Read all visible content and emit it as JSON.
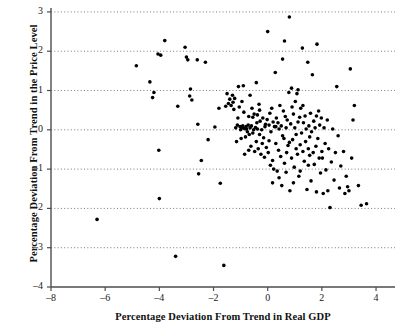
{
  "chart_data": {
    "type": "scatter",
    "title": "",
    "xlabel": "Percentage Deviation From Trend in Real GDP",
    "ylabel": "Percentage Deviation From Trend in the Price Level",
    "xlim": [
      -8,
      4.7
    ],
    "ylim": [
      -4,
      3.1
    ],
    "xticks": [
      -8,
      -6,
      -4,
      -2,
      0,
      2,
      4
    ],
    "xticklabels": [
      "–8",
      "–6",
      "–4",
      "–2",
      "0",
      "2",
      "4"
    ],
    "yticks": [
      -4,
      -3,
      -2,
      -1,
      0,
      1,
      2,
      3
    ],
    "yticklabels": [
      "–4",
      "–3",
      "–2",
      "–1",
      "0",
      "1",
      "2",
      "3"
    ],
    "grid": {
      "horizontal": true,
      "vertical": false,
      "style": "dotted",
      "color": "#555555",
      "values": [
        3,
        2,
        1,
        0,
        -1,
        -2,
        -3
      ]
    },
    "marker": {
      "shape": "circle",
      "color": "#000000",
      "size_px": 3.6
    },
    "axis_color": "#4d4d4d",
    "points": [
      [
        -6.3,
        -2.28
      ],
      [
        -4.85,
        1.63
      ],
      [
        -4.35,
        1.22
      ],
      [
        -4.25,
        0.82
      ],
      [
        -4.2,
        0.95
      ],
      [
        -4.05,
        1.93
      ],
      [
        -4.02,
        -0.52
      ],
      [
        -4.0,
        -1.75
      ],
      [
        -3.95,
        1.9
      ],
      [
        -3.8,
        2.27
      ],
      [
        -3.4,
        -3.22
      ],
      [
        -3.32,
        0.6
      ],
      [
        -3.05,
        2.1
      ],
      [
        -3.0,
        1.85
      ],
      [
        -2.95,
        1.78
      ],
      [
        -2.88,
        0.86
      ],
      [
        -2.85,
        1.04
      ],
      [
        -2.8,
        0.76
      ],
      [
        -2.6,
        1.78
      ],
      [
        -2.58,
        0.14
      ],
      [
        -2.55,
        -1.12
      ],
      [
        -2.45,
        -0.78
      ],
      [
        -2.3,
        1.72
      ],
      [
        -2.2,
        -0.25
      ],
      [
        -1.95,
        0.07
      ],
      [
        -1.8,
        0.55
      ],
      [
        -1.75,
        -1.36
      ],
      [
        -1.62,
        -3.45
      ],
      [
        -1.55,
        0.6
      ],
      [
        -1.45,
        0.67
      ],
      [
        -1.4,
        0.78
      ],
      [
        -1.35,
        0.62
      ],
      [
        -1.3,
        0.88
      ],
      [
        -1.28,
        0.7
      ],
      [
        -1.22,
        0.8
      ],
      [
        -1.18,
        0.05
      ],
      [
        -1.15,
        -0.3
      ],
      [
        -1.12,
        0.12
      ],
      [
        -1.08,
        1.1
      ],
      [
        -1.05,
        0.58
      ],
      [
        -1.02,
        0.08
      ],
      [
        -1.0,
        0.0
      ],
      [
        -0.98,
        -0.22
      ],
      [
        -0.95,
        0.05
      ],
      [
        -0.92,
        0.1
      ],
      [
        -0.9,
        1.12
      ],
      [
        -0.88,
        0.45
      ],
      [
        -0.85,
        0.03
      ],
      [
        -0.82,
        -0.18
      ],
      [
        -0.8,
        0.08
      ],
      [
        -0.78,
        0.02
      ],
      [
        -0.75,
        -0.05
      ],
      [
        -0.72,
        0.12
      ],
      [
        -0.7,
        0.34
      ],
      [
        -0.68,
        -0.12
      ],
      [
        -0.65,
        0.05
      ],
      [
        -0.62,
        -0.42
      ],
      [
        -0.6,
        0.1
      ],
      [
        -0.58,
        0.55
      ],
      [
        -0.55,
        -0.08
      ],
      [
        -0.52,
        0.0
      ],
      [
        -0.5,
        0.4
      ],
      [
        -0.48,
        -0.55
      ],
      [
        -0.45,
        0.06
      ],
      [
        -0.42,
        -0.3
      ],
      [
        -0.4,
        0.18
      ],
      [
        -0.38,
        0.02
      ],
      [
        -0.35,
        -0.48
      ],
      [
        -0.32,
        0.65
      ],
      [
        -0.3,
        -0.12
      ],
      [
        -0.28,
        0.22
      ],
      [
        -0.25,
        -0.62
      ],
      [
        -0.22,
        0.0
      ],
      [
        -0.2,
        -0.35
      ],
      [
        -0.18,
        0.3
      ],
      [
        -0.15,
        -0.2
      ],
      [
        -0.12,
        -0.7
      ],
      [
        -0.1,
        0.08
      ],
      [
        -0.08,
        0.14
      ],
      [
        -0.05,
        -0.45
      ],
      [
        -0.02,
        0.26
      ],
      [
        0.0,
        2.5
      ],
      [
        0.02,
        -0.58
      ],
      [
        0.05,
        0.12
      ],
      [
        0.08,
        0.42
      ],
      [
        0.1,
        -0.9
      ],
      [
        0.12,
        -0.05
      ],
      [
        0.15,
        0.55
      ],
      [
        0.18,
        -0.78
      ],
      [
        0.2,
        0.2
      ],
      [
        0.22,
        -1.0
      ],
      [
        0.25,
        0.08
      ],
      [
        0.28,
        1.46
      ],
      [
        0.3,
        -0.35
      ],
      [
        0.32,
        0.3
      ],
      [
        0.35,
        -1.05
      ],
      [
        0.38,
        0.18
      ],
      [
        0.4,
        -0.52
      ],
      [
        0.42,
        0.02
      ],
      [
        0.45,
        0.62
      ],
      [
        0.48,
        -0.68
      ],
      [
        0.5,
        0.1
      ],
      [
        0.52,
        -1.42
      ],
      [
        0.55,
        1.8
      ],
      [
        0.58,
        0.48
      ],
      [
        0.6,
        -0.22
      ],
      [
        0.62,
        -0.85
      ],
      [
        0.65,
        0.34
      ],
      [
        0.68,
        0.05
      ],
      [
        0.7,
        -0.58
      ],
      [
        0.72,
        0.25
      ],
      [
        0.75,
        -0.4
      ],
      [
        0.78,
        0.95
      ],
      [
        0.8,
        2.87
      ],
      [
        0.82,
        -1.55
      ],
      [
        0.85,
        0.15
      ],
      [
        0.88,
        -0.72
      ],
      [
        0.9,
        0.58
      ],
      [
        0.92,
        -0.25
      ],
      [
        0.95,
        0.4
      ],
      [
        0.98,
        -0.95
      ],
      [
        1.0,
        0.05
      ],
      [
        1.02,
        0.72
      ],
      [
        1.05,
        -0.48
      ],
      [
        1.08,
        0.92
      ],
      [
        1.1,
        -0.62
      ],
      [
        1.12,
        0.2
      ],
      [
        1.15,
        -1.18
      ],
      [
        1.18,
        0.32
      ],
      [
        1.2,
        -0.38
      ],
      [
        1.22,
        0.55
      ],
      [
        1.25,
        -0.08
      ],
      [
        1.28,
        2.08
      ],
      [
        1.3,
        -0.55
      ],
      [
        1.32,
        0.18
      ],
      [
        1.35,
        -0.8
      ],
      [
        1.38,
        0.35
      ],
      [
        1.4,
        -0.3
      ],
      [
        1.42,
        0.02
      ],
      [
        1.45,
        -1.52
      ],
      [
        1.48,
        1.72
      ],
      [
        1.5,
        -0.48
      ],
      [
        1.52,
        0.1
      ],
      [
        1.55,
        -0.65
      ],
      [
        1.58,
        0.42
      ],
      [
        1.6,
        -1.3
      ],
      [
        1.62,
        -0.05
      ],
      [
        1.65,
        1.4
      ],
      [
        1.68,
        -0.58
      ],
      [
        1.7,
        0.22
      ],
      [
        1.72,
        -0.88
      ],
      [
        1.75,
        0.05
      ],
      [
        1.78,
        -0.42
      ],
      [
        1.8,
        -1.58
      ],
      [
        1.82,
        2.18
      ],
      [
        1.85,
        -0.22
      ],
      [
        1.88,
        0.48
      ],
      [
        1.9,
        -0.72
      ],
      [
        1.92,
        0.12
      ],
      [
        1.95,
        -1.1
      ],
      [
        1.98,
        0.3
      ],
      [
        2.0,
        -0.55
      ],
      [
        2.05,
        -1.62
      ],
      [
        2.08,
        0.05
      ],
      [
        2.12,
        -0.35
      ],
      [
        2.15,
        -1.02
      ],
      [
        2.2,
        0.25
      ],
      [
        2.25,
        -0.48
      ],
      [
        2.3,
        -1.98
      ],
      [
        2.35,
        -0.82
      ],
      [
        2.4,
        0.02
      ],
      [
        2.45,
        -1.28
      ],
      [
        2.5,
        -0.58
      ],
      [
        2.55,
        1.1
      ],
      [
        2.6,
        -0.15
      ],
      [
        2.65,
        -1.48
      ],
      [
        2.7,
        -0.92
      ],
      [
        2.8,
        -0.55
      ],
      [
        2.85,
        -1.62
      ],
      [
        2.9,
        -1.18
      ],
      [
        2.95,
        -1.45
      ],
      [
        3.0,
        -1.55
      ],
      [
        3.05,
        1.55
      ],
      [
        3.1,
        -0.72
      ],
      [
        3.15,
        0.25
      ],
      [
        3.2,
        0.62
      ],
      [
        3.35,
        -1.42
      ],
      [
        3.45,
        -1.92
      ],
      [
        3.65,
        -1.88
      ],
      [
        -1.5,
        0.92
      ],
      [
        -1.25,
        0.52
      ],
      [
        -0.95,
        0.72
      ],
      [
        -0.7,
        -0.52
      ],
      [
        -0.55,
        0.32
      ],
      [
        -0.3,
        0.5
      ],
      [
        0.05,
        -0.28
      ],
      [
        0.3,
        0.08
      ],
      [
        0.55,
        -0.15
      ],
      [
        0.8,
        -0.32
      ],
      [
        1.05,
        -0.12
      ],
      [
        1.3,
        0.62
      ],
      [
        1.55,
        -0.18
      ],
      [
        1.8,
        0.35
      ],
      [
        0.88,
        1.06
      ],
      [
        1.12,
        1.02
      ],
      [
        -0.42,
        1.2
      ],
      [
        0.62,
        2.26
      ],
      [
        -1.1,
        0.3
      ],
      [
        -0.85,
        -0.62
      ],
      [
        0.18,
        -1.35
      ],
      [
        0.42,
        -1.22
      ],
      [
        0.68,
        -1.08
      ],
      [
        0.95,
        -1.35
      ],
      [
        1.2,
        -1.05
      ],
      [
        1.5,
        -0.9
      ],
      [
        2.02,
        -0.72
      ],
      [
        2.22,
        -1.55
      ],
      [
        -0.65,
        0.88
      ],
      [
        -0.38,
        0.38
      ]
    ]
  }
}
